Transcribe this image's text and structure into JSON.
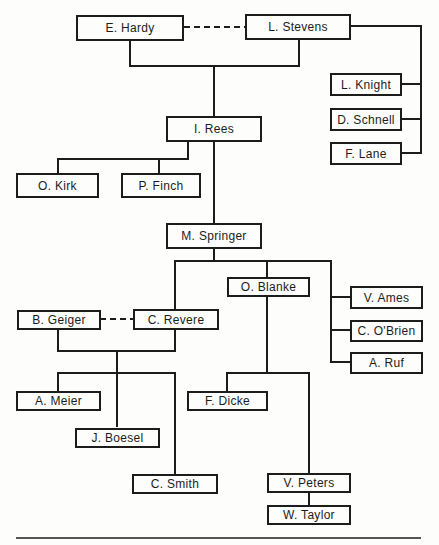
{
  "diagram": {
    "type": "organization-chart",
    "nodes": {
      "hardy": "E. Hardy",
      "stevens": "L. Stevens",
      "knight": "L. Knight",
      "schnell": "D. Schnell",
      "lane": "F. Lane",
      "rees": "I. Rees",
      "kirk": "O. Kirk",
      "finch": "P. Finch",
      "springer": "M. Springer",
      "blanke": "O. Blanke",
      "ames": "V. Ames",
      "obrien": "C. O'Brien",
      "ruf": "A. Ruf",
      "geiger": "B. Geiger",
      "revere": "C. Revere",
      "meier": "A. Meier",
      "boesel": "J. Boesel",
      "smith": "C. Smith",
      "dicke": "F. Dicke",
      "peters": "V. Peters",
      "taylor": "W. Taylor"
    },
    "edges": [
      {
        "from": "E. Hardy",
        "to": "L. Stevens",
        "style": "dashed"
      },
      {
        "from": "E. Hardy + L. Stevens",
        "to": "I. Rees",
        "style": "solid"
      },
      {
        "from": "L. Stevens",
        "to": "L. Knight",
        "style": "solid"
      },
      {
        "from": "L. Stevens",
        "to": "D. Schnell",
        "style": "solid"
      },
      {
        "from": "L. Stevens",
        "to": "F. Lane",
        "style": "solid"
      },
      {
        "from": "I. Rees",
        "to": "O. Kirk",
        "style": "solid"
      },
      {
        "from": "I. Rees",
        "to": "P. Finch",
        "style": "solid"
      },
      {
        "from": "I. Rees",
        "to": "M. Springer",
        "style": "solid"
      },
      {
        "from": "M. Springer",
        "to": "C. Revere",
        "style": "solid"
      },
      {
        "from": "M. Springer",
        "to": "O. Blanke",
        "style": "solid"
      },
      {
        "from": "M. Springer",
        "to": "V. Ames",
        "style": "solid"
      },
      {
        "from": "M. Springer",
        "to": "C. O'Brien",
        "style": "solid"
      },
      {
        "from": "M. Springer",
        "to": "A. Ruf",
        "style": "solid"
      },
      {
        "from": "B. Geiger",
        "to": "C. Revere",
        "style": "dashed"
      },
      {
        "from": "B. Geiger + C. Revere",
        "to": "A. Meier",
        "style": "solid"
      },
      {
        "from": "B. Geiger + C. Revere",
        "to": "J. Boesel",
        "style": "solid"
      },
      {
        "from": "B. Geiger + C. Revere",
        "to": "C. Smith",
        "style": "solid"
      },
      {
        "from": "O. Blanke",
        "to": "F. Dicke",
        "style": "solid"
      },
      {
        "from": "O. Blanke",
        "to": "V. Peters",
        "style": "solid"
      },
      {
        "from": "V. Peters",
        "to": "W. Taylor",
        "style": "solid"
      }
    ]
  }
}
